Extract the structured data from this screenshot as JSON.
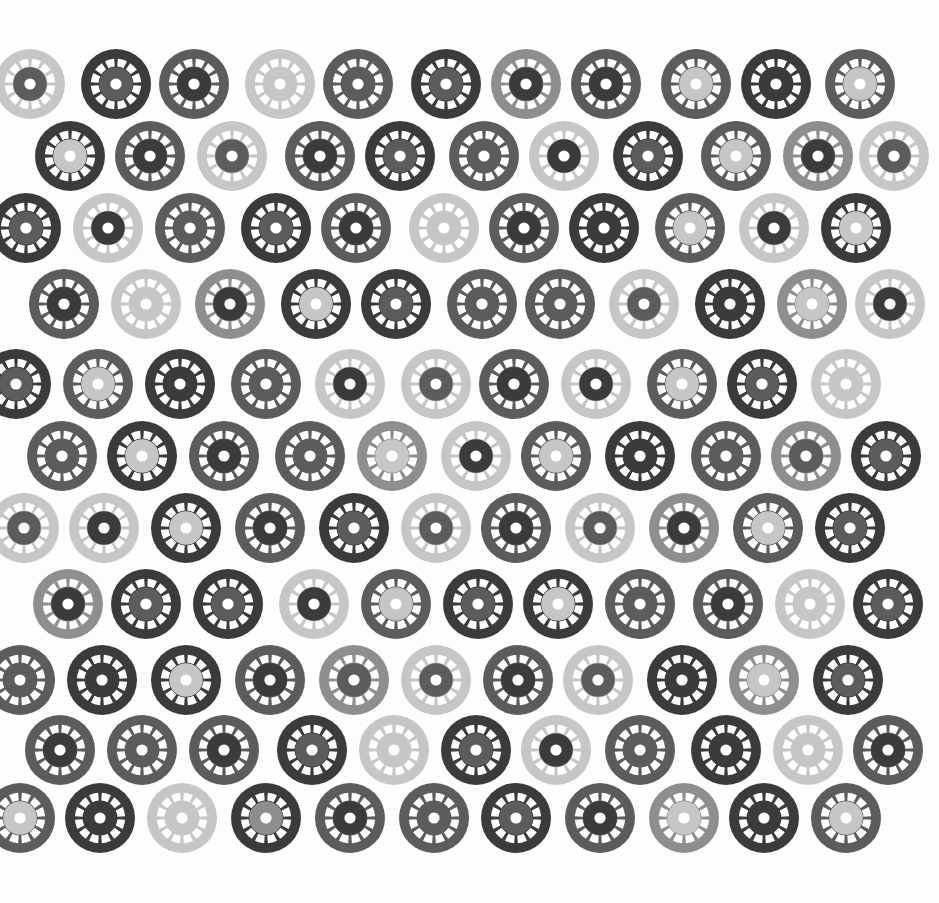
{
  "image": {
    "description": "Pattern of grey printed wheel/disc motifs on white paper",
    "background": "#fdfdfd",
    "width": 939,
    "height": 903
  },
  "palette": [
    "#3b3b3b",
    "#5c5c5c",
    "#8e8e8e",
    "#c6c6c6"
  ],
  "disc": {
    "radius": 35,
    "slots": 12,
    "hole_color": "#ffffff"
  },
  "rows": [
    {
      "y": 84,
      "x": [
        22,
        108,
        186,
        272,
        350,
        438,
        518,
        598,
        688,
        768,
        852
      ],
      "c": [
        [
          3,
          1
        ],
        [
          0,
          1
        ],
        [
          1,
          0
        ],
        [
          3,
          3
        ],
        [
          1,
          1
        ],
        [
          0,
          1
        ],
        [
          2,
          0
        ],
        [
          1,
          0
        ],
        [
          1,
          3
        ],
        [
          0,
          0
        ],
        [
          1,
          3
        ]
      ]
    },
    {
      "y": 156,
      "x": [
        62,
        142,
        224,
        312,
        392,
        476,
        556,
        640,
        728,
        810,
        886
      ],
      "c": [
        [
          0,
          3
        ],
        [
          1,
          0
        ],
        [
          3,
          1
        ],
        [
          1,
          0
        ],
        [
          0,
          1
        ],
        [
          1,
          1
        ],
        [
          3,
          0
        ],
        [
          0,
          1
        ],
        [
          1,
          3
        ],
        [
          2,
          0
        ],
        [
          3,
          1
        ]
      ]
    },
    {
      "y": 228,
      "x": [
        18,
        100,
        182,
        268,
        348,
        436,
        516,
        596,
        682,
        766,
        848
      ],
      "c": [
        [
          0,
          1
        ],
        [
          3,
          0
        ],
        [
          1,
          1
        ],
        [
          0,
          1
        ],
        [
          1,
          0
        ],
        [
          3,
          3
        ],
        [
          1,
          0
        ],
        [
          0,
          0
        ],
        [
          1,
          3
        ],
        [
          3,
          0
        ],
        [
          0,
          3
        ]
      ]
    },
    {
      "y": 304,
      "x": [
        56,
        138,
        222,
        308,
        388,
        474,
        552,
        636,
        722,
        804,
        882
      ],
      "c": [
        [
          1,
          0
        ],
        [
          3,
          3
        ],
        [
          2,
          0
        ],
        [
          0,
          3
        ],
        [
          0,
          1
        ],
        [
          1,
          1
        ],
        [
          1,
          1
        ],
        [
          3,
          1
        ],
        [
          0,
          0
        ],
        [
          2,
          3
        ],
        [
          3,
          0
        ]
      ]
    },
    {
      "y": 384,
      "x": [
        8,
        90,
        172,
        258,
        342,
        428,
        506,
        588,
        674,
        754,
        838
      ],
      "c": [
        [
          0,
          1
        ],
        [
          1,
          3
        ],
        [
          0,
          0
        ],
        [
          1,
          1
        ],
        [
          3,
          0
        ],
        [
          3,
          1
        ],
        [
          1,
          0
        ],
        [
          3,
          0
        ],
        [
          1,
          3
        ],
        [
          0,
          1
        ],
        [
          3,
          3
        ]
      ]
    },
    {
      "y": 456,
      "x": [
        54,
        134,
        216,
        302,
        384,
        468,
        548,
        632,
        718,
        798,
        878
      ],
      "c": [
        [
          1,
          1
        ],
        [
          0,
          3
        ],
        [
          1,
          0
        ],
        [
          1,
          1
        ],
        [
          2,
          3
        ],
        [
          3,
          0
        ],
        [
          1,
          3
        ],
        [
          0,
          0
        ],
        [
          1,
          1
        ],
        [
          2,
          1
        ],
        [
          0,
          1
        ]
      ]
    },
    {
      "y": 528,
      "x": [
        16,
        96,
        178,
        262,
        346,
        428,
        508,
        592,
        676,
        760,
        842
      ],
      "c": [
        [
          3,
          1
        ],
        [
          3,
          0
        ],
        [
          0,
          3
        ],
        [
          1,
          0
        ],
        [
          0,
          1
        ],
        [
          3,
          1
        ],
        [
          1,
          0
        ],
        [
          3,
          1
        ],
        [
          2,
          0
        ],
        [
          1,
          3
        ],
        [
          0,
          1
        ]
      ]
    },
    {
      "y": 604,
      "x": [
        60,
        138,
        220,
        306,
        388,
        470,
        550,
        632,
        720,
        802,
        880
      ],
      "c": [
        [
          2,
          0
        ],
        [
          0,
          1
        ],
        [
          0,
          1
        ],
        [
          3,
          0
        ],
        [
          1,
          3
        ],
        [
          0,
          1
        ],
        [
          0,
          3
        ],
        [
          1,
          1
        ],
        [
          1,
          0
        ],
        [
          3,
          3
        ],
        [
          0,
          1
        ]
      ]
    },
    {
      "y": 680,
      "x": [
        12,
        94,
        178,
        262,
        346,
        428,
        510,
        590,
        674,
        756,
        840
      ],
      "c": [
        [
          1,
          1
        ],
        [
          0,
          0
        ],
        [
          0,
          3
        ],
        [
          1,
          0
        ],
        [
          2,
          1
        ],
        [
          3,
          1
        ],
        [
          1,
          0
        ],
        [
          3,
          1
        ],
        [
          0,
          0
        ],
        [
          2,
          3
        ],
        [
          0,
          1
        ]
      ]
    },
    {
      "y": 750,
      "x": [
        52,
        134,
        216,
        304,
        386,
        468,
        548,
        632,
        718,
        800,
        880
      ],
      "c": [
        [
          1,
          0
        ],
        [
          1,
          1
        ],
        [
          1,
          0
        ],
        [
          0,
          1
        ],
        [
          3,
          3
        ],
        [
          0,
          1
        ],
        [
          3,
          0
        ],
        [
          1,
          1
        ],
        [
          0,
          0
        ],
        [
          3,
          3
        ],
        [
          1,
          0
        ]
      ]
    },
    {
      "y": 818,
      "x": [
        12,
        92,
        174,
        258,
        342,
        426,
        508,
        592,
        676,
        756,
        838
      ],
      "c": [
        [
          1,
          3
        ],
        [
          0,
          0
        ],
        [
          3,
          3
        ],
        [
          0,
          2
        ],
        [
          1,
          0
        ],
        [
          1,
          1
        ],
        [
          0,
          1
        ],
        [
          1,
          0
        ],
        [
          2,
          3
        ],
        [
          0,
          0
        ],
        [
          1,
          3
        ]
      ]
    }
  ]
}
